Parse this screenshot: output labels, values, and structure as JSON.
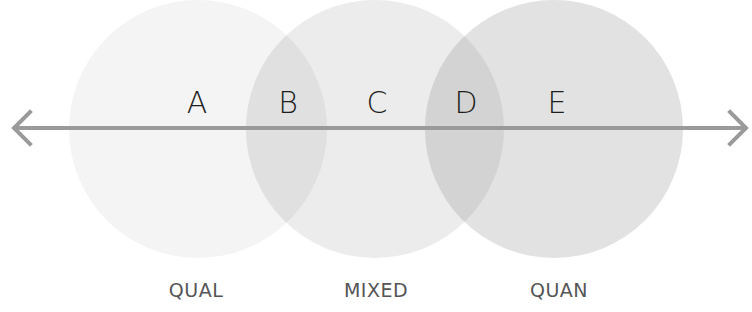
{
  "diagram": {
    "title": "",
    "axis": {
      "color": "#9a9a9a",
      "y": 128,
      "x_start": 13,
      "x_end": 747,
      "direction": "bidirectional"
    },
    "circles": [
      {
        "id": "qual",
        "cx": 198,
        "cy": 129,
        "r": 129,
        "color": "#f4f4f4",
        "label": "QUAL"
      },
      {
        "id": "mixed",
        "cx": 375,
        "cy": 129,
        "r": 129,
        "color": "#ececec",
        "label": "MIXED"
      },
      {
        "id": "quan",
        "cx": 554,
        "cy": 129,
        "r": 129,
        "color": "#e2e2e2",
        "label": "QUAN"
      }
    ],
    "overlaps": [
      {
        "id": "B",
        "between": [
          "qual",
          "mixed"
        ],
        "color": "#e0e0e0"
      },
      {
        "id": "D",
        "between": [
          "mixed",
          "quan"
        ],
        "color": "#d3d3d3"
      }
    ],
    "letters": [
      {
        "text": "A",
        "x": 197
      },
      {
        "text": "B",
        "x": 288
      },
      {
        "text": "C",
        "x": 377
      },
      {
        "text": "D",
        "x": 466
      },
      {
        "text": "E",
        "x": 557
      }
    ],
    "captions": [
      {
        "text": "QUAL",
        "x": 196
      },
      {
        "text": "MIXED",
        "x": 376
      },
      {
        "text": "QUAN",
        "x": 559
      }
    ]
  }
}
